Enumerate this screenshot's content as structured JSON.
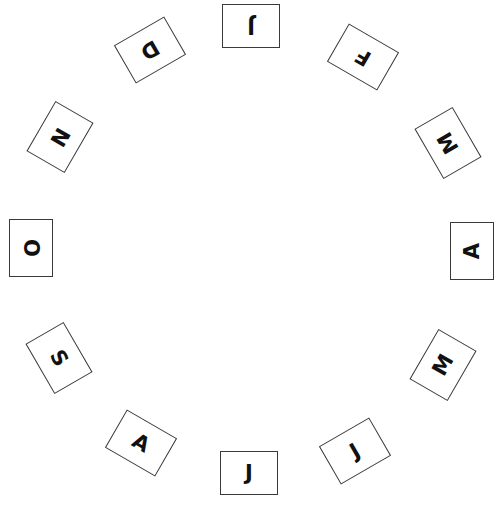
{
  "colors": {
    "background": "#ffffff",
    "card_border": "#3a3a3a",
    "letter": "#111111"
  },
  "card_size": {
    "width": 58,
    "height": 44
  },
  "cards": [
    {
      "letter": "J",
      "month_position": 1,
      "cx": 251,
      "cy": 26,
      "rotation": 180
    },
    {
      "letter": "F",
      "month_position": 2,
      "cx": 363,
      "cy": 57,
      "rotation": 210
    },
    {
      "letter": "M",
      "month_position": 3,
      "cx": 448,
      "cy": 143,
      "rotation": 240
    },
    {
      "letter": "A",
      "month_position": 4,
      "cx": 472,
      "cy": 251,
      "rotation": 270
    },
    {
      "letter": "M",
      "month_position": 5,
      "cx": 443,
      "cy": 365,
      "rotation": 300
    },
    {
      "letter": "J",
      "month_position": 6,
      "cx": 355,
      "cy": 451,
      "rotation": 330
    },
    {
      "letter": "J",
      "month_position": 7,
      "cx": 249,
      "cy": 473,
      "rotation": 0
    },
    {
      "letter": "A",
      "month_position": 8,
      "cx": 141,
      "cy": 443,
      "rotation": 30
    },
    {
      "letter": "S",
      "month_position": 9,
      "cx": 59,
      "cy": 358,
      "rotation": 60
    },
    {
      "letter": "O",
      "month_position": 10,
      "cx": 31,
      "cy": 248,
      "rotation": 90
    },
    {
      "letter": "N",
      "month_position": 11,
      "cx": 60,
      "cy": 137,
      "rotation": 120
    },
    {
      "letter": "D",
      "month_position": 12,
      "cx": 150,
      "cy": 50,
      "rotation": 150
    }
  ]
}
